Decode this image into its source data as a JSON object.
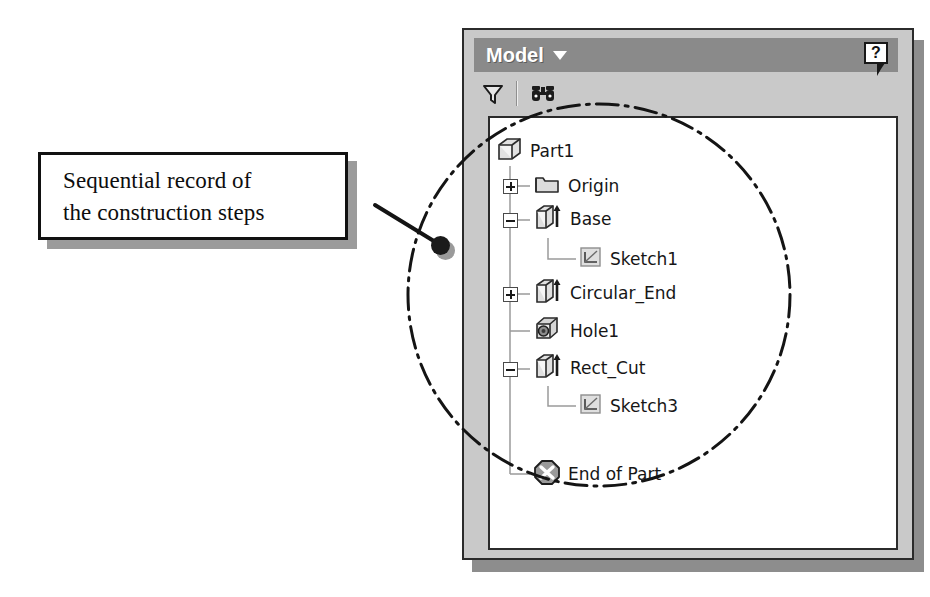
{
  "callout": {
    "line1": "Sequential record of",
    "line2": "the construction steps"
  },
  "panel": {
    "title": "Model",
    "title_caret_icon": "chevron-down-icon",
    "help_label": "?",
    "help_icon": "help-balloon-icon",
    "toolbar": {
      "filter_icon": "filter-funnel-icon",
      "find_icon": "binoculars-search-icon"
    }
  },
  "tree": {
    "nodes": [
      {
        "label": "Part1",
        "icon": "part-cube-icon",
        "expander": "none",
        "indent": 0
      },
      {
        "label": "Origin",
        "icon": "folder-icon",
        "expander": "plus",
        "indent": 1
      },
      {
        "label": "Base",
        "icon": "extrude-icon",
        "expander": "minus",
        "indent": 1
      },
      {
        "label": "Sketch1",
        "icon": "sketch-icon",
        "expander": "none",
        "indent": 2
      },
      {
        "label": "Circular_End",
        "icon": "extrude-icon",
        "expander": "plus",
        "indent": 1
      },
      {
        "label": "Hole1",
        "icon": "hole-cube-icon",
        "expander": "none",
        "indent": 1
      },
      {
        "label": "Rect_Cut",
        "icon": "extrude-icon",
        "expander": "minus",
        "indent": 1
      },
      {
        "label": "Sketch3",
        "icon": "sketch-icon",
        "expander": "none",
        "indent": 2
      },
      {
        "label": "End of Part",
        "icon": "end-of-part-icon",
        "expander": "none",
        "indent": 1
      }
    ]
  },
  "annotation": {
    "highlight_shape": "dash-dot-circle",
    "leader_endpoint_icon": "leader-dot"
  },
  "colors": {
    "titlebar": "#8a8a8a",
    "panel_face": "#c9c9c9",
    "tree_background": "#ffffff",
    "outline": "#2b2b2b",
    "shadow": "#8d8d8d"
  }
}
